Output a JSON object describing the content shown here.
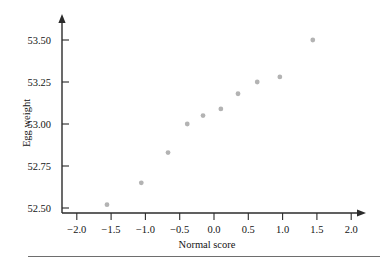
{
  "chart_data": {
    "type": "scatter",
    "title": "",
    "xlabel": "Normal score",
    "ylabel": "Egg weight",
    "xlim": [
      -2.25,
      2.2
    ],
    "ylim": [
      52.46,
      53.62
    ],
    "grid": false,
    "legend": null,
    "x_ticks": [
      -2.0,
      -1.5,
      -1.0,
      -0.5,
      0.0,
      0.5,
      1.0,
      1.5,
      2.0
    ],
    "x_tick_labels": [
      "−2.0",
      "−1.5",
      "−1.0",
      "−0.5",
      "0.0",
      "0.5",
      "1.0",
      "1.5",
      "2.0"
    ],
    "y_ticks": [
      52.5,
      52.75,
      53.0,
      53.25,
      53.5
    ],
    "y_tick_labels": [
      "52.50",
      "52.75",
      "53.00",
      "53.25",
      "53.50"
    ],
    "marker_color": "#b3b3b3",
    "axis_color": "#2b2b2b",
    "x": [
      -1.56,
      -1.06,
      -0.67,
      -0.39,
      -0.16,
      0.1,
      0.35,
      0.63,
      0.96,
      1.44
    ],
    "y": [
      52.52,
      52.65,
      52.83,
      53.0,
      53.05,
      53.09,
      53.18,
      53.25,
      53.28,
      53.5
    ],
    "points": [
      {
        "x": -1.56,
        "y": 52.52
      },
      {
        "x": -1.06,
        "y": 52.65
      },
      {
        "x": -0.67,
        "y": 52.83
      },
      {
        "x": -0.39,
        "y": 53.0
      },
      {
        "x": -0.16,
        "y": 53.05
      },
      {
        "x": 0.1,
        "y": 53.09
      },
      {
        "x": 0.35,
        "y": 53.18
      },
      {
        "x": 0.63,
        "y": 53.25
      },
      {
        "x": 0.96,
        "y": 53.28
      },
      {
        "x": 1.44,
        "y": 53.5
      }
    ]
  }
}
